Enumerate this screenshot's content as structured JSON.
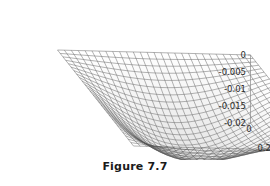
{
  "caption": "Figure 7.7",
  "chart_data": {
    "type": "surface",
    "title": "",
    "xlabel": "x",
    "ylabel": "y",
    "zlabel": "",
    "xticks": [
      "1",
      "0.8",
      "0.6",
      "0.4",
      "0.2",
      "0"
    ],
    "xtickvalues": [
      1,
      0.8,
      0.6,
      0.4,
      0.2,
      0
    ],
    "yticks": [
      "0",
      "0.2",
      "0.4",
      "0.6",
      "0.8",
      "1"
    ],
    "ytickvalues": [
      0,
      0.2,
      0.4,
      0.6,
      0.8,
      1
    ],
    "zticks": [
      "0",
      "-0.005",
      "-0.01",
      "-0.015",
      "-0.02"
    ],
    "ztickvalues": [
      0,
      -0.005,
      -0.01,
      -0.015,
      -0.02
    ],
    "xlim": [
      0,
      1
    ],
    "ylim": [
      0,
      1
    ],
    "zlim": [
      -0.02,
      0
    ],
    "grid": false,
    "legend": false,
    "mesh": {
      "nx": 28,
      "ny": 28,
      "style": "wireframe-shaded"
    },
    "surface_description": "Negative bowl/valley surface, zero along the x=0 and y=0 boundary edges, dipping to a minimum of about -0.02 near the front interior",
    "min_value": -0.02,
    "max_value": 0
  },
  "axes": {
    "x_axis_name": "x",
    "y_axis_name": "y",
    "corner_label_left": "1",
    "corner_label_right": "1"
  }
}
